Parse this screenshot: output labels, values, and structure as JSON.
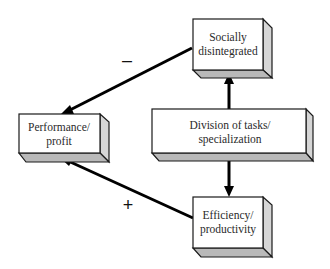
{
  "diagram": {
    "nodes": [
      {
        "id": "socially_disintegrated",
        "line1": "Socially",
        "line2": "disintegrated"
      },
      {
        "id": "performance_profit",
        "line1": "Performance/",
        "line2": "profit"
      },
      {
        "id": "division_of_tasks",
        "line1": "Division of tasks/",
        "line2": "specialization"
      },
      {
        "id": "efficiency_productivity",
        "line1": "Efficiency/",
        "line2": "productivity"
      }
    ],
    "edges": [
      {
        "from": "division_of_tasks",
        "to": "socially_disintegrated",
        "sign": ""
      },
      {
        "from": "division_of_tasks",
        "to": "efficiency_productivity",
        "sign": ""
      },
      {
        "from": "socially_disintegrated",
        "to": "performance_profit",
        "sign": "–"
      },
      {
        "from": "efficiency_productivity",
        "to": "performance_profit",
        "sign": "+"
      }
    ],
    "colors": {
      "box_face": "#ffffff",
      "box_side": "#d6d6d6",
      "box_bottom": "#b9b9b9",
      "line": "#000000"
    }
  }
}
